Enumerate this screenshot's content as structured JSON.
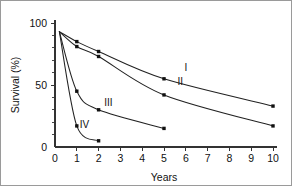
{
  "figure": {
    "name": "survival-curves-figure",
    "background_color": "#ffffff",
    "border_color": "#9a9a9a",
    "line_color": "#222222",
    "marker_color": "#111111",
    "axis_color": "#333333"
  },
  "chart_data": {
    "type": "line",
    "title": "",
    "subtitle": "",
    "xlabel": "Years",
    "ylabel": "Survival (%)",
    "xlim": [
      0,
      10
    ],
    "ylim": [
      0,
      100
    ],
    "xticks": [
      0,
      1,
      2,
      3,
      4,
      5,
      6,
      7,
      8,
      9,
      10
    ],
    "xticklabels": [
      "0",
      "1",
      "2",
      "3",
      "4",
      "5",
      "6",
      "7",
      "8",
      "9",
      "10"
    ],
    "yticks": [
      0,
      50,
      100
    ],
    "yticklabels": [
      "0",
      "50",
      "100"
    ],
    "yminorticks": [
      10,
      20,
      30,
      40,
      60,
      70,
      80,
      90
    ],
    "grid": false,
    "legend": "inline-curve-labels",
    "series": [
      {
        "name": "I",
        "label": "I",
        "label_x": 6.0,
        "label_y": 61,
        "x": [
          0.2,
          1,
          2,
          5,
          10
        ],
        "y": [
          93,
          85,
          77,
          55,
          33
        ],
        "markers_x": [
          1,
          2,
          5,
          10
        ],
        "markers_y": [
          85,
          77,
          55,
          33
        ]
      },
      {
        "name": "II",
        "label": "II",
        "label_x": 5.75,
        "label_y": 50,
        "x": [
          0.2,
          1,
          2,
          5,
          10
        ],
        "y": [
          93,
          81,
          73,
          42,
          17
        ],
        "markers_x": [
          1,
          2,
          5,
          10
        ],
        "markers_y": [
          81,
          73,
          42,
          17
        ]
      },
      {
        "name": "III",
        "label": "III",
        "label_x": 2.45,
        "label_y": 33,
        "x": [
          0.2,
          1,
          2,
          5
        ],
        "y": [
          93,
          45,
          30,
          15
        ],
        "markers_x": [
          1,
          2,
          5
        ],
        "markers_y": [
          45,
          30,
          15
        ]
      },
      {
        "name": "IV",
        "label": "IV",
        "label_x": 1.35,
        "label_y": 15,
        "x": [
          0.2,
          1,
          2
        ],
        "y": [
          93,
          17,
          5
        ],
        "markers_x": [
          1,
          2
        ],
        "markers_y": [
          17,
          5
        ]
      }
    ]
  }
}
